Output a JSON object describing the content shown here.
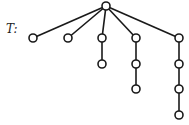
{
  "title": "T:",
  "stroke_color": "#1a1a1a",
  "node_fill": "#ffffff",
  "nodes": [
    {
      "id": "root",
      "x": 106,
      "y": 6
    },
    {
      "id": "a1",
      "x": 33,
      "y": 38
    },
    {
      "id": "b1",
      "x": 68,
      "y": 38
    },
    {
      "id": "c1",
      "x": 102,
      "y": 38
    },
    {
      "id": "c2",
      "x": 102,
      "y": 64
    },
    {
      "id": "d1",
      "x": 136,
      "y": 38
    },
    {
      "id": "d2",
      "x": 136,
      "y": 64
    },
    {
      "id": "d3",
      "x": 136,
      "y": 89
    },
    {
      "id": "e1",
      "x": 179,
      "y": 38
    },
    {
      "id": "e2",
      "x": 179,
      "y": 64
    },
    {
      "id": "e3",
      "x": 179,
      "y": 89
    },
    {
      "id": "e4",
      "x": 179,
      "y": 115
    }
  ],
  "edges": [
    [
      "root",
      "a1"
    ],
    [
      "root",
      "b1"
    ],
    [
      "root",
      "c1"
    ],
    [
      "root",
      "d1"
    ],
    [
      "root",
      "e1"
    ],
    [
      "c1",
      "c2"
    ],
    [
      "d1",
      "d2"
    ],
    [
      "d2",
      "d3"
    ],
    [
      "e1",
      "e2"
    ],
    [
      "e2",
      "e3"
    ],
    [
      "e3",
      "e4"
    ]
  ]
}
